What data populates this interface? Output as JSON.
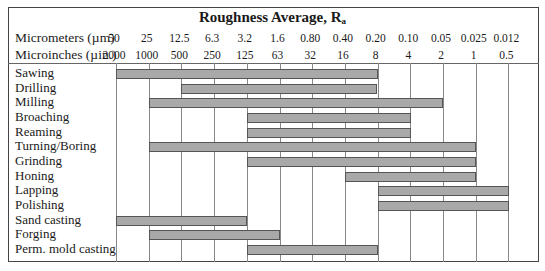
{
  "chart_data": {
    "type": "bar",
    "subtype": "range-bar (horizontal, floating)",
    "title": "Roughness Average, Ra",
    "title_main": "Roughness Average, R",
    "title_subscript": "a",
    "axis_rows": [
      {
        "label": "Micrometers (µm)",
        "ticks": [
          "50",
          "25",
          "12.5",
          "6.3",
          "3.2",
          "1.6",
          "0.80",
          "0.40",
          "0.20",
          "0.10",
          "0.05",
          "0.025",
          "0.012"
        ]
      },
      {
        "label": "Microinches (µin.)",
        "ticks": [
          "2000",
          "1000",
          "500",
          "250",
          "125",
          "63",
          "32",
          "16",
          "8",
          "4",
          "2",
          "1",
          "0.5"
        ]
      }
    ],
    "grid": true,
    "legend": null,
    "categories": [
      "Sawing",
      "Drilling",
      "Milling",
      "Broaching",
      "Reaming",
      "Turning/Boring",
      "Grinding",
      "Honing",
      "Lapping",
      "Polishing",
      "Sand casting",
      "Forging",
      "Perm. mold casting"
    ],
    "ranges_um": [
      {
        "process": "Sawing",
        "from": 50,
        "to": 0.8
      },
      {
        "process": "Drilling",
        "from": 12.5,
        "to": 0.8
      },
      {
        "process": "Milling",
        "from": 25,
        "to": 0.2
      },
      {
        "process": "Broaching",
        "from": 6.3,
        "to": 0.4
      },
      {
        "process": "Reaming",
        "from": 6.3,
        "to": 0.4
      },
      {
        "process": "Turning/Boring",
        "from": 25,
        "to": 0.025
      },
      {
        "process": "Grinding",
        "from": 6.3,
        "to": 0.025
      },
      {
        "process": "Honing",
        "from": 1.6,
        "to": 0.025
      },
      {
        "process": "Lapping",
        "from": 0.8,
        "to": 0.012
      },
      {
        "process": "Polishing",
        "from": 0.8,
        "to": 0.012
      },
      {
        "process": "Sand casting",
        "from": 50,
        "to": 6.3
      },
      {
        "process": "Forging",
        "from": 25,
        "to": 1.6
      },
      {
        "process": "Perm. mold casting",
        "from": 6.3,
        "to": 0.8
      }
    ],
    "bar_index_ranges": [
      [
        0,
        8
      ],
      [
        2,
        8
      ],
      [
        1,
        10
      ],
      [
        4,
        9
      ],
      [
        4,
        9
      ],
      [
        1,
        11
      ],
      [
        4,
        11
      ],
      [
        7,
        11
      ],
      [
        8,
        12
      ],
      [
        8,
        12
      ],
      [
        0,
        4
      ],
      [
        1,
        5
      ],
      [
        4,
        8
      ]
    ],
    "colors": {
      "bar_fill": "#a9a9a9",
      "bar_border": "#555555",
      "grid": "#888888"
    }
  }
}
